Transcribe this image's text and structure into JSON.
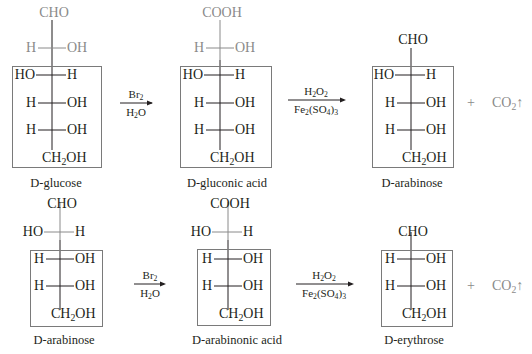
{
  "colors": {
    "text": "#231f20",
    "gray": "#8a8a8a",
    "box_border": "#7a7a7a"
  },
  "reactions": [
    {
      "row": 1,
      "title": "Ruff degradation of D-glucose to D-arabinose",
      "step1_reagents": {
        "above": "Br2",
        "below": "H2O"
      },
      "step2_reagents": {
        "above": "H2O2",
        "below": "Fe2(SO4)3"
      },
      "byproduct": "+ CO2↑",
      "molecules": [
        {
          "name_prefix": "D",
          "name": "-glucose",
          "top_group": "CHO",
          "rows": [
            {
              "left": "H",
              "right": "OH",
              "boxed": false,
              "gray": true
            },
            {
              "left": "HO",
              "right": "H",
              "boxed": true
            },
            {
              "left": "H",
              "right": "OH",
              "boxed": true
            },
            {
              "left": "H",
              "right": "OH",
              "boxed": true
            }
          ],
          "bottom_group": "CH2OH"
        },
        {
          "name_prefix": "D",
          "name": "-gluconic acid",
          "top_group": "COOH",
          "rows": [
            {
              "left": "H",
              "right": "OH",
              "boxed": false,
              "gray": true
            },
            {
              "left": "HO",
              "right": "H",
              "boxed": true
            },
            {
              "left": "H",
              "right": "OH",
              "boxed": true
            },
            {
              "left": "H",
              "right": "OH",
              "boxed": true
            }
          ],
          "bottom_group": "CH2OH"
        },
        {
          "name_prefix": "D",
          "name": "-arabinose",
          "top_group": "CHO",
          "rows": [
            {
              "left": "HO",
              "right": "H",
              "boxed": true
            },
            {
              "left": "H",
              "right": "OH",
              "boxed": true
            },
            {
              "left": "H",
              "right": "OH",
              "boxed": true
            }
          ],
          "bottom_group": "CH2OH"
        }
      ]
    },
    {
      "row": 2,
      "title": "Ruff degradation of D-arabinose to D-erythrose",
      "step1_reagents": {
        "above": "Br2",
        "below": "H2O"
      },
      "step2_reagents": {
        "above": "H2O2",
        "below": "Fe2(SO4)3"
      },
      "byproduct": "+ CO2↑",
      "molecules": [
        {
          "name_prefix": "D",
          "name": "-arabinose",
          "top_group": "CHO",
          "rows": [
            {
              "left": "HO",
              "right": "H",
              "boxed": false,
              "gray": true
            },
            {
              "left": "H",
              "right": "OH",
              "boxed": true
            },
            {
              "left": "H",
              "right": "OH",
              "boxed": true
            }
          ],
          "bottom_group": "CH2OH"
        },
        {
          "name_prefix": "D",
          "name": "-arabinonic acid",
          "top_group": "COOH",
          "rows": [
            {
              "left": "HO",
              "right": "H",
              "boxed": false,
              "gray": true
            },
            {
              "left": "H",
              "right": "OH",
              "boxed": true
            },
            {
              "left": "H",
              "right": "OH",
              "boxed": true
            }
          ],
          "bottom_group": "CH2OH"
        },
        {
          "name_prefix": "D",
          "name": "-erythrose",
          "top_group": "CHO",
          "rows": [
            {
              "left": "H",
              "right": "OH",
              "boxed": true
            },
            {
              "left": "H",
              "right": "OH",
              "boxed": true
            }
          ],
          "bottom_group": "CH2OH"
        }
      ]
    }
  ],
  "text": {
    "cho": "CHO",
    "cooh": "COOH",
    "h": "H",
    "oh": "OH",
    "ho": "HO",
    "ch": "CH",
    "two": "2",
    "three": "3",
    "four": "4",
    "br": "Br",
    "o": "O",
    "fe": "Fe",
    "so": "(SO",
    "close": ")",
    "plus": "+",
    "co": "CO",
    "up": "↑",
    "d": "D",
    "glucose": "-glucose",
    "gluconic": "-gluconic acid",
    "arabinose": "-arabinose",
    "arabinonic": "-arabinonic acid",
    "erythrose": "-erythrose"
  }
}
